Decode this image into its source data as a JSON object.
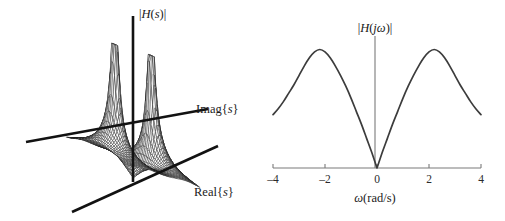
{
  "figure": {
    "background_color": "#ffffff",
    "width": 505,
    "height": 221
  },
  "panel_3d": {
    "name": "s-plane magnitude surface",
    "vertical_axis_label": "|H(s)|",
    "axis_imag_label": "Imag{s}",
    "axis_real_label": "Real{s}",
    "axis_color": "#121212",
    "mesh_color": "#1b1b1b",
    "description": "Wireframe surface of |H(s)| over the complex s-plane showing two tall resonant peaks at conjugate poles and a valley at the origin."
  },
  "panel_2d": {
    "name": "frequency response magnitude",
    "vertical_axis_label": "|H(jω)|",
    "x_axis_label": "ω(rad/s)",
    "axis_color": "#7a7a7a",
    "curve_color": "#3c3c3c"
  },
  "chart_data": [
    {
      "type": "line",
      "title": "",
      "xlabel": "ω(rad/s)",
      "ylabel": "|H(jω)|",
      "xlim": [
        -4,
        4
      ],
      "ylim": [
        0,
        1.08
      ],
      "xticks": [
        -4,
        -2,
        0,
        2,
        4
      ],
      "xticklabels": [
        "–4",
        "–2",
        "0",
        "2",
        "4"
      ],
      "yticks": [],
      "grid": false,
      "legend": false,
      "annotations": [
        "Zero of magnitude at ω = 0",
        "Resonant peaks near ω = ±2.2 rad/s"
      ],
      "x": [
        -4.0,
        -3.8,
        -3.6,
        -3.4,
        -3.2,
        -3.0,
        -2.8,
        -2.6,
        -2.4,
        -2.2,
        -2.0,
        -1.8,
        -1.6,
        -1.4,
        -1.2,
        -1.0,
        -0.8,
        -0.6,
        -0.4,
        -0.2,
        0.0,
        0.2,
        0.4,
        0.6,
        0.8,
        1.0,
        1.2,
        1.4,
        1.6,
        1.8,
        2.0,
        2.2,
        2.4,
        2.6,
        2.8,
        3.0,
        3.2,
        3.4,
        3.6,
        3.8,
        4.0
      ],
      "values": [
        0.45,
        0.5,
        0.56,
        0.63,
        0.7,
        0.78,
        0.86,
        0.93,
        0.98,
        1.0,
        0.98,
        0.93,
        0.86,
        0.78,
        0.69,
        0.59,
        0.48,
        0.37,
        0.25,
        0.13,
        0.0,
        0.13,
        0.25,
        0.37,
        0.48,
        0.59,
        0.69,
        0.78,
        0.86,
        0.93,
        0.98,
        1.0,
        0.98,
        0.93,
        0.86,
        0.78,
        0.7,
        0.63,
        0.56,
        0.5,
        0.45
      ]
    },
    {
      "type": "surface",
      "title": "",
      "xlabel": "Real{s}",
      "ylabel": "Imag{s}",
      "zlabel": "|H(s)|",
      "grid": false,
      "legend": false,
      "annotations": [
        "Two sharp peaks correspond to the complex-conjugate pole pair",
        "Surface dips to zero at the origin of the s-plane"
      ],
      "peaks": [
        {
          "real": 0.0,
          "imag": -2.2,
          "height": 1.0
        },
        {
          "real": 0.0,
          "imag": 2.2,
          "height": 1.0
        }
      ]
    }
  ]
}
